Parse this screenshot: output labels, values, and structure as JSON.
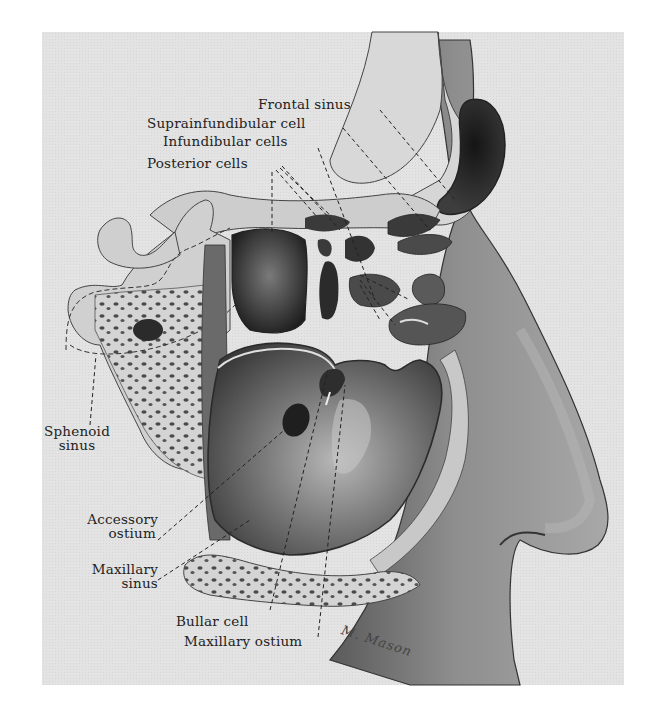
{
  "figure": {
    "signature": "M. Mason",
    "colors": {
      "page_background": "#ffffff",
      "plate_background": "#e3e3e3",
      "ink": "#222222",
      "sinus_dark": "#2a2a2a",
      "bone": "#cfcfcf",
      "skin_shadow": "#6e6e6e"
    },
    "labels": [
      {
        "id": "frontal-sinus",
        "text": "Frontal sinus"
      },
      {
        "id": "suprainfundibular-cell",
        "text": "Suprainfundibular cell"
      },
      {
        "id": "infundibular-cells",
        "text": "Infundibular cells"
      },
      {
        "id": "posterior-cells",
        "text": "Posterior cells"
      },
      {
        "id": "sphenoid-sinus",
        "line1": "Sphenoid",
        "line2": "sinus"
      },
      {
        "id": "accessory-ostium",
        "line1": "Accessory",
        "line2": "ostium"
      },
      {
        "id": "maxillary-sinus",
        "line1": "Maxillary",
        "line2": "sinus"
      },
      {
        "id": "bullar-cell",
        "text": "Bullar cell"
      },
      {
        "id": "maxillary-ostium",
        "text": "Maxillary ostium"
      }
    ]
  }
}
